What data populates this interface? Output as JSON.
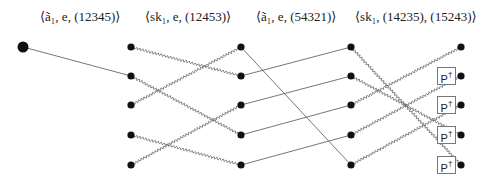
{
  "diagram": {
    "labels": [
      {
        "text": "⟨ã₁, e, (12345)⟩",
        "x": 40
      },
      {
        "text": "⟨sk₁, e, (12453)⟩",
        "x": 145
      },
      {
        "text": "⟨ã₁, e, (54321)⟩",
        "x": 256
      },
      {
        "text": "⟨sk₁, (14235), (15243)⟩",
        "x": 355
      }
    ],
    "columns_x": [
      23,
      131,
      241,
      351,
      461
    ],
    "rows_y": [
      47,
      76,
      105,
      135,
      165
    ],
    "start_node": {
      "col": 0,
      "row": 0,
      "radius": 5.5
    },
    "node_radius": 3.6,
    "edges": [
      {
        "from": [
          0,
          0
        ],
        "to": [
          1,
          1
        ],
        "style": "straight"
      },
      {
        "from": [
          1,
          0
        ],
        "to": [
          2,
          1
        ],
        "style": "wavy"
      },
      {
        "from": [
          1,
          1
        ],
        "to": [
          2,
          3
        ],
        "style": "wavy"
      },
      {
        "from": [
          1,
          2
        ],
        "to": [
          2,
          0
        ],
        "style": "wavy"
      },
      {
        "from": [
          1,
          3
        ],
        "to": [
          2,
          4
        ],
        "style": "wavy"
      },
      {
        "from": [
          1,
          4
        ],
        "to": [
          2,
          2
        ],
        "style": "wavy"
      },
      {
        "from": [
          2,
          0
        ],
        "to": [
          3,
          4
        ],
        "style": "straight"
      },
      {
        "from": [
          2,
          1
        ],
        "to": [
          3,
          0
        ],
        "style": "straight"
      },
      {
        "from": [
          2,
          2
        ],
        "to": [
          3,
          1
        ],
        "style": "straight"
      },
      {
        "from": [
          2,
          3
        ],
        "to": [
          3,
          2
        ],
        "style": "straight"
      },
      {
        "from": [
          2,
          4
        ],
        "to": [
          3,
          3
        ],
        "style": "straight"
      },
      {
        "from": [
          3,
          0
        ],
        "to": [
          4,
          4
        ],
        "style": "wavy"
      },
      {
        "from": [
          3,
          1
        ],
        "to": [
          4,
          3
        ],
        "style": "wavy"
      },
      {
        "from": [
          3,
          2
        ],
        "to": [
          4,
          0
        ],
        "style": "wavy"
      },
      {
        "from": [
          3,
          3
        ],
        "to": [
          4,
          1
        ],
        "style": "wavy"
      },
      {
        "from": [
          3,
          4
        ],
        "to": [
          4,
          2
        ],
        "style": "wavy"
      }
    ],
    "gates": [
      {
        "label": "P",
        "sup": "†",
        "row": 1
      },
      {
        "label": "P",
        "sup": "†",
        "row": 2
      },
      {
        "label": "P",
        "sup": "†",
        "row": 3
      },
      {
        "label": "P",
        "sup": "†",
        "row": 4
      }
    ],
    "colors": {
      "node": "#111111",
      "edge": "#666666",
      "box_border": "#777777"
    }
  }
}
